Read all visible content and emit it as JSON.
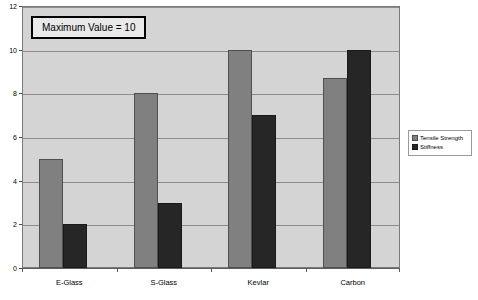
{
  "chart_data": {
    "type": "bar",
    "title": "",
    "xlabel": "",
    "ylabel": "",
    "ylim": [
      0,
      12
    ],
    "ytick_step": 2,
    "yticks": [
      0,
      2,
      4,
      6,
      8,
      10,
      12
    ],
    "ytick_labels": [
      "0",
      "2",
      "4",
      "6",
      "8",
      "10",
      "12"
    ],
    "grid": true,
    "legend_position": "right",
    "categories": [
      "E-Glass",
      "S-Glass",
      "Kevlar",
      "Carbon"
    ],
    "series": [
      {
        "name": "Tensile Strength",
        "color": "#808080",
        "values": [
          5,
          8,
          10,
          8.7
        ]
      },
      {
        "name": "Stiffness",
        "color": "#262626",
        "values": [
          2,
          3,
          7,
          10
        ]
      }
    ],
    "annotations": [
      {
        "text": "Maximum Value = 10"
      }
    ]
  },
  "legend": {
    "items": [
      {
        "label": "Tensile Strength"
      },
      {
        "label": "Stiffness"
      }
    ]
  },
  "annotation": {
    "text": "Maximum Value = 10"
  },
  "colors": {
    "plot_background": "#d4d4d4",
    "page_background": "#ffffff",
    "gridline": "#8c8c8c",
    "frame_border": "#7a7a7a",
    "series_tensile": "#808080",
    "series_stiffness": "#262626"
  }
}
